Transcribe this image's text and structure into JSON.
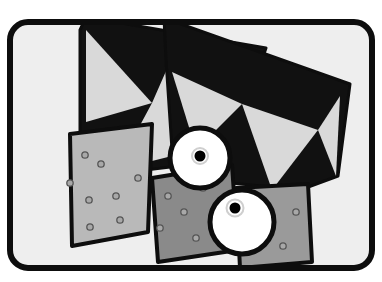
{
  "canvas": {
    "width": 382,
    "height": 282,
    "background_color": "#ffffff",
    "title": "Abstract black and white illustration with fan shapes, riveted panels and two eyes"
  },
  "palette": {
    "paper_white": "#ffffff",
    "frame_fill": "#eeeeee",
    "outline_black": "#0d0d0d",
    "fan_black": "#111111",
    "triangle_light": "#d9d9d9",
    "panel_light_gray": "#b9b9b9",
    "panel_mid_gray": "#9a9a9a",
    "panel_dark_gray": "#8a8a8a",
    "rivet_fill": "#a8a8a8",
    "rivet_stroke": "#555555",
    "eye_white": "#ffffff",
    "pupil_black": "#000000"
  },
  "frame": {
    "name": "rounded-rectangle-border",
    "x": 10,
    "y": 22,
    "width": 362,
    "height": 246,
    "corner_radius": 18,
    "stroke_width": 6,
    "stroke_color": "#0d0d0d",
    "fill_color": "#eeeeee"
  },
  "fans": [
    {
      "name": "left-fan",
      "fill": "#111111",
      "stroke": "#0d0d0d",
      "stroke_width": 3,
      "points": "86,17 266,48 228,160 104,175 80,164 80,30",
      "triangles": [
        {
          "name": "left-fan-triangle-1",
          "fill": "#d9d9d9",
          "points": "86,30 86,122 152,103"
        },
        {
          "name": "left-fan-triangle-2",
          "fill": "#d9d9d9",
          "points": "152,103 116,170 196,150 170,62"
        }
      ]
    },
    {
      "name": "right-fan",
      "fill": "#111111",
      "stroke": "#0d0d0d",
      "stroke_width": 3,
      "points": "164,18 350,84 338,176 300,190 182,178 172,150 166,60",
      "triangles": [
        {
          "name": "right-fan-triangle-1",
          "fill": "#d9d9d9",
          "points": "172,72 196,150 242,104"
        },
        {
          "name": "right-fan-triangle-2",
          "fill": "#d9d9d9",
          "points": "242,104 272,190 318,130"
        },
        {
          "name": "right-fan-triangle-3",
          "fill": "#d9d9d9",
          "points": "318,130 336,176 340,96"
        }
      ]
    }
  ],
  "panels": [
    {
      "name": "left-riveted-panel",
      "fill": "#b9b9b9",
      "stroke": "#0d0d0d",
      "stroke_width": 4,
      "points": "70,134 152,124 148,232 72,246",
      "rivets": [
        {
          "cx": 85,
          "cy": 155
        },
        {
          "cx": 101,
          "cy": 164
        },
        {
          "cx": 70,
          "cy": 183
        },
        {
          "cx": 138,
          "cy": 178
        },
        {
          "cx": 116,
          "cy": 196
        },
        {
          "cx": 89,
          "cy": 200
        },
        {
          "cx": 120,
          "cy": 220
        },
        {
          "cx": 90,
          "cy": 227
        }
      ]
    },
    {
      "name": "center-riveted-panel",
      "fill": "#8a8a8a",
      "stroke": "#0d0d0d",
      "stroke_width": 4,
      "points": "152,178 232,165 238,250 158,262",
      "rivets": [
        {
          "cx": 168,
          "cy": 196
        },
        {
          "cx": 203,
          "cy": 188
        },
        {
          "cx": 184,
          "cy": 212
        },
        {
          "cx": 214,
          "cy": 217
        },
        {
          "cx": 160,
          "cy": 228
        },
        {
          "cx": 196,
          "cy": 238
        },
        {
          "cx": 226,
          "cy": 244
        }
      ]
    },
    {
      "name": "right-riveted-panel",
      "fill": "#9a9a9a",
      "stroke": "#0d0d0d",
      "stroke_width": 4,
      "points": "236,188 308,184 312,262 240,268",
      "rivets": [
        {
          "cx": 296,
          "cy": 212
        },
        {
          "cx": 247,
          "cy": 228
        },
        {
          "cx": 283,
          "cy": 246
        }
      ]
    }
  ],
  "eyes": [
    {
      "name": "upper-eye",
      "cx": 200,
      "cy": 158,
      "r": 30,
      "ring_color": "#0d0d0d",
      "ring_width": 5,
      "sclera_color": "#ffffff",
      "pupil": {
        "cx": 200,
        "cy": 156,
        "r": 5.5,
        "color": "#000000",
        "halo_r": 8,
        "halo_color": "#cfcfcf"
      }
    },
    {
      "name": "lower-eye",
      "cx": 242,
      "cy": 222,
      "r": 32,
      "ring_color": "#0d0d0d",
      "ring_width": 5,
      "sclera_color": "#ffffff",
      "pupil": {
        "cx": 235,
        "cy": 208,
        "r": 5.5,
        "color": "#000000",
        "halo_r": 8.5,
        "halo_color": "#cfcfcf"
      }
    }
  ]
}
